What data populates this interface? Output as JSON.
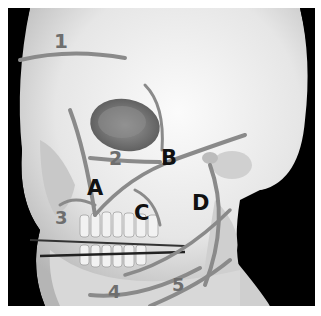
{
  "figure": {
    "number_labels": [
      {
        "id": "1",
        "text": "1",
        "x": 62,
        "y": 48
      },
      {
        "id": "2",
        "text": "2",
        "x": 117,
        "y": 162
      },
      {
        "id": "3",
        "text": "3",
        "x": 62,
        "y": 222
      },
      {
        "id": "4",
        "text": "4",
        "x": 115,
        "y": 297
      },
      {
        "id": "5",
        "text": "5",
        "x": 180,
        "y": 289
      }
    ],
    "letter_labels": [
      {
        "id": "A",
        "text": "A",
        "x": 96,
        "y": 193
      },
      {
        "id": "B",
        "text": "B",
        "x": 170,
        "y": 163
      },
      {
        "id": "C",
        "text": "C",
        "x": 143,
        "y": 218
      },
      {
        "id": "D",
        "text": "D",
        "x": 201,
        "y": 208
      }
    ],
    "colors": {
      "background": "#000000",
      "bone": "#e8e8e8",
      "line": "#8a8a8a",
      "letter": "#111111",
      "number": "#6e6e6e"
    }
  }
}
